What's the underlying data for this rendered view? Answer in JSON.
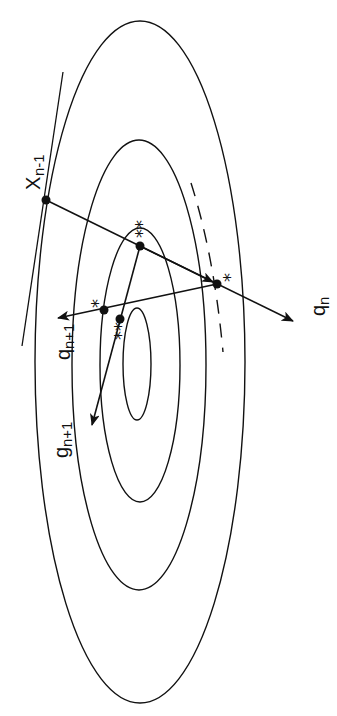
{
  "figure": {
    "colors": {
      "ink": "#111111",
      "background": "#ffffff"
    },
    "contours": [
      {
        "id": "outer",
        "cx": 140,
        "cy": 362,
        "rx": 105,
        "ry": 341
      },
      {
        "id": "second",
        "cx": 139,
        "cy": 365,
        "rx": 67,
        "ry": 225
      },
      {
        "id": "third",
        "cx": 140,
        "cy": 365,
        "rx": 40,
        "ry": 137
      },
      {
        "id": "inner",
        "cx": 137,
        "cy": 364,
        "rx": 14,
        "ry": 56
      }
    ],
    "points": {
      "x_prev": {
        "x": 46,
        "y": 200
      },
      "double_star_upper": {
        "x": 140,
        "y": 246
      },
      "star_right": {
        "x": 217,
        "y": 284
      },
      "star_left": {
        "x": 104,
        "y": 310
      },
      "double_star_lower": {
        "x": 120,
        "y": 319
      }
    },
    "labels": {
      "x_prev": "X",
      "x_prev_sub": "n-1",
      "q_n": "q",
      "q_n_sub": "n",
      "q_next": "q",
      "q_next_sub": "n+1",
      "g_next": "g",
      "g_next_sub": "n+1",
      "double_star": "**",
      "single_star": "*"
    }
  }
}
